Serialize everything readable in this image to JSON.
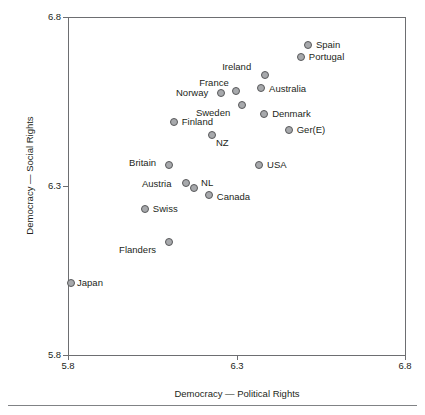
{
  "chart_data": {
    "type": "scatter",
    "title": "",
    "xlabel": "Democracy — Political Rights",
    "ylabel": "Democracy — Social Rights",
    "xlim": [
      5.8,
      6.8
    ],
    "ylim": [
      5.8,
      6.8
    ],
    "xticks": [
      "5.8",
      "6.3",
      "6.8"
    ],
    "yticks": [
      "5.8",
      "6.3",
      "6.8"
    ],
    "xtick_values": [
      5.8,
      6.3,
      6.8
    ],
    "ytick_values": [
      5.8,
      6.3,
      6.8
    ],
    "grid": false,
    "legend": false,
    "marker_fill": "#a7a9ac",
    "marker_edge": "#58595b",
    "axis_color": "#6d6e71",
    "points": [
      {
        "label": "Spain",
        "x": 6.512,
        "y": 6.717,
        "label_dx": 8,
        "label_dy": -5
      },
      {
        "label": "Portugal",
        "x": 6.491,
        "y": 6.682,
        "label_dx": 8,
        "label_dy": -5
      },
      {
        "label": "Ireland",
        "x": 6.385,
        "y": 6.629,
        "label_dx": -43,
        "label_dy": -13
      },
      {
        "label": "Australia",
        "x": 6.373,
        "y": 6.591,
        "label_dx": 8,
        "label_dy": -4
      },
      {
        "label": "France",
        "x": 6.299,
        "y": 6.582,
        "label_dx": -37,
        "label_dy": -13
      },
      {
        "label": "Norway",
        "x": 6.254,
        "y": 6.576,
        "label_dx": -45,
        "label_dy": -5
      },
      {
        "label": "Sweden",
        "x": 6.316,
        "y": 6.541,
        "label_dx": -46,
        "label_dy": 3
      },
      {
        "label": "Denmark",
        "x": 6.382,
        "y": 6.512,
        "label_dx": 8,
        "label_dy": -5
      },
      {
        "label": "Finland",
        "x": 6.114,
        "y": 6.488,
        "label_dx": 8,
        "label_dy": -5
      },
      {
        "label": "Ger(E)",
        "x": 6.455,
        "y": 6.467,
        "label_dx": 8,
        "label_dy": -5
      },
      {
        "label": "NZ",
        "x": 6.227,
        "y": 6.45,
        "label_dx": 4,
        "label_dy": 3
      },
      {
        "label": "Britain",
        "x": 6.1,
        "y": 6.362,
        "label_dx": -40,
        "label_dy": -7
      },
      {
        "label": "USA",
        "x": 6.367,
        "y": 6.362,
        "label_dx": 8,
        "label_dy": -5
      },
      {
        "label": "Austria",
        "x": 6.15,
        "y": 6.309,
        "label_dx": -44,
        "label_dy": -4
      },
      {
        "label": "NL",
        "x": 6.174,
        "y": 6.294,
        "label_dx": 7,
        "label_dy": -10
      },
      {
        "label": "Canada",
        "x": 6.218,
        "y": 6.273,
        "label_dx": 8,
        "label_dy": -3
      },
      {
        "label": "Swiss",
        "x": 6.028,
        "y": 6.231,
        "label_dx": 8,
        "label_dy": -5
      },
      {
        "label": "Flanders",
        "x": 6.1,
        "y": 6.133,
        "label_dx": -50,
        "label_dy": 3
      },
      {
        "label": "Japan",
        "x": 5.809,
        "y": 6.012,
        "label_dx": 6,
        "label_dy": -5
      }
    ]
  },
  "figure": {
    "plot_left_px": 68,
    "plot_top_px": 17,
    "plot_width_px": 337,
    "plot_height_px": 338
  }
}
